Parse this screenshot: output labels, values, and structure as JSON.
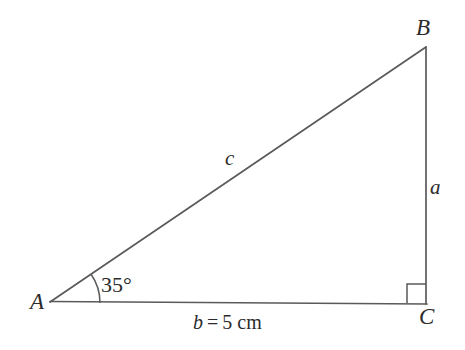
{
  "figure": {
    "kind": "right-triangle-diagram",
    "background_color": "#ffffff",
    "stroke_color": "#5a5a5a",
    "text_color": "#2b2b2b",
    "vertices": {
      "A": {
        "label": "A",
        "x": 50,
        "y": 303
      },
      "B": {
        "label": "B",
        "x": 426,
        "y": 47
      },
      "C": {
        "label": "C",
        "x": 426,
        "y": 303
      }
    },
    "sides": {
      "a": {
        "label": "a",
        "from": "B",
        "to": "C"
      },
      "b": {
        "label": "b",
        "from": "A",
        "to": "C"
      },
      "c": {
        "label": "c",
        "from": "A",
        "to": "B"
      }
    },
    "angle_at_A": {
      "label": "35°",
      "value": 35,
      "unit": "degrees",
      "arc_radius": 50
    },
    "right_angle_at_C": {
      "marker": "square",
      "value": 90,
      "unit": "degrees",
      "size": 19
    },
    "measurement": {
      "symbol": "b",
      "equals": "=",
      "value": "5",
      "unit": "cm",
      "full_text": "b = 5 cm"
    }
  }
}
